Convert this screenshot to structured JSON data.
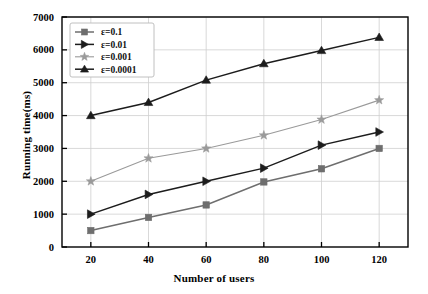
{
  "chart_data": {
    "type": "line",
    "title": "",
    "xlabel": "Number of users",
    "ylabel": "Running time(ms)",
    "x": [
      20,
      40,
      60,
      80,
      100,
      120
    ],
    "xlim": [
      10,
      130
    ],
    "ylim": [
      0,
      7000
    ],
    "xticks": [
      20,
      40,
      60,
      80,
      100,
      120
    ],
    "yticks": [
      0,
      1000,
      2000,
      3000,
      4000,
      5000,
      6000,
      7000
    ],
    "grid": true,
    "legend_position": "upper-left",
    "series": [
      {
        "name": "ε=0.1",
        "marker": "square",
        "color": "#6e6e6e",
        "values": [
          500,
          900,
          1280,
          1980,
          2380,
          3000
        ]
      },
      {
        "name": "ε=0.01",
        "marker": "right-triangle",
        "color": "#1c1c1c",
        "values": [
          1000,
          1600,
          2000,
          2400,
          3100,
          3500
        ]
      },
      {
        "name": "ε=0.001",
        "marker": "star",
        "color": "#9a9a9a",
        "values": [
          2000,
          2700,
          3000,
          3400,
          3880,
          4470
        ]
      },
      {
        "name": "ε=0.0001",
        "marker": "up-triangle",
        "color": "#1c1c1c",
        "values": [
          4000,
          4400,
          5080,
          5580,
          5980,
          6380
        ]
      }
    ]
  },
  "axes": {
    "xtick_labels": [
      "20",
      "40",
      "60",
      "80",
      "100",
      "120"
    ],
    "ytick_labels": [
      "0",
      "1000",
      "2000",
      "3000",
      "4000",
      "5000",
      "6000",
      "7000"
    ]
  },
  "legend": {
    "items": [
      {
        "label": "ε=0.1"
      },
      {
        "label": "ε=0.01"
      },
      {
        "label": "ε=0.001"
      },
      {
        "label": "ε=0.0001"
      }
    ]
  },
  "colors": {
    "background": "#ffffff",
    "axis": "#000000",
    "grid": "#cfcfcf",
    "legend_border": "#b9b9b9"
  }
}
